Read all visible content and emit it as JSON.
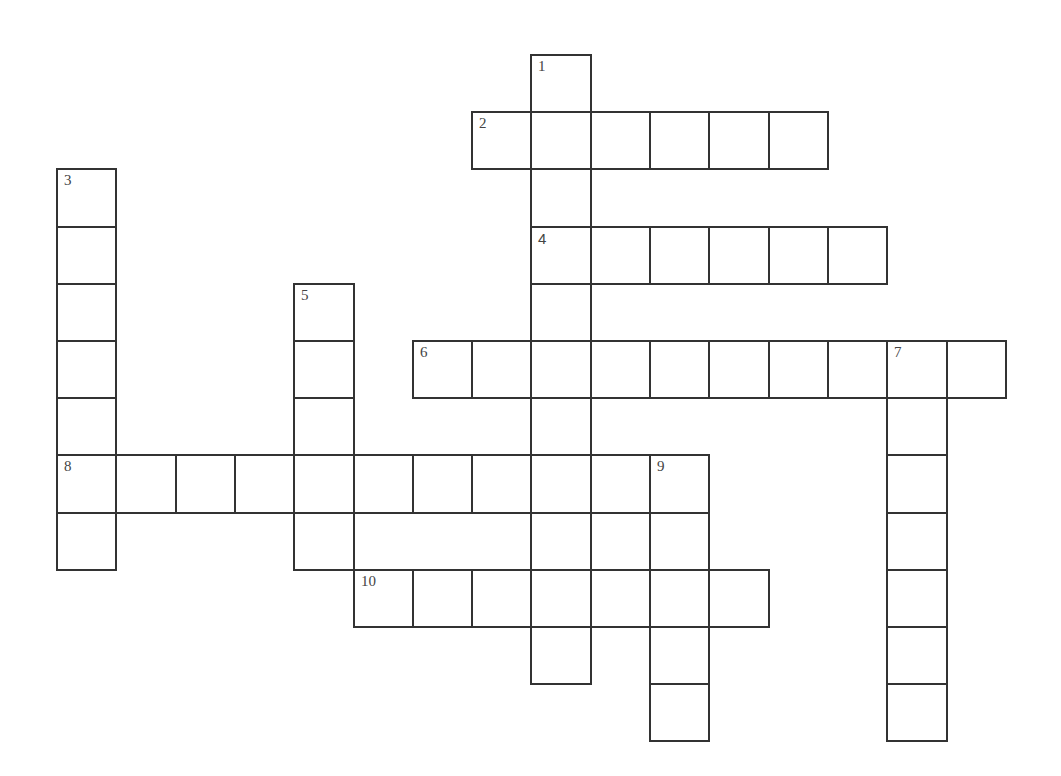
{
  "puzzle": {
    "origin_x": 56,
    "origin_y": 54,
    "cell_w": 59.3,
    "cell_h": 57.2,
    "border_color": "#333333",
    "entries": [
      {
        "number": "1",
        "direction": "down",
        "row": 0,
        "col": 8,
        "length": 11
      },
      {
        "number": "2",
        "direction": "across",
        "row": 1,
        "col": 7,
        "length": 6
      },
      {
        "number": "3",
        "direction": "down",
        "row": 2,
        "col": 0,
        "length": 7
      },
      {
        "number": "4",
        "direction": "across",
        "row": 3,
        "col": 8,
        "length": 6
      },
      {
        "number": "5",
        "direction": "down",
        "row": 4,
        "col": 4,
        "length": 5
      },
      {
        "number": "6",
        "direction": "across",
        "row": 5,
        "col": 6,
        "length": 10
      },
      {
        "number": "7",
        "direction": "down",
        "row": 5,
        "col": 14,
        "length": 7
      },
      {
        "number": "8",
        "direction": "across",
        "row": 7,
        "col": 0,
        "length": 11
      },
      {
        "number": "9",
        "direction": "down",
        "row": 7,
        "col": 10,
        "length": 5
      },
      {
        "number": "10",
        "direction": "across",
        "row": 9,
        "col": 5,
        "length": 7
      }
    ]
  }
}
